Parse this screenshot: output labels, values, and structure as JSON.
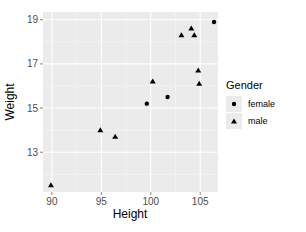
{
  "chart_data": {
    "type": "scatter",
    "title": "",
    "xlabel": "Height",
    "ylabel": "Weight",
    "xlim": [
      89.1,
      106.8
    ],
    "ylim": [
      11.2,
      19.35
    ],
    "xticks": [
      90,
      95,
      100,
      105
    ],
    "yticks": [
      13,
      15,
      17,
      19
    ],
    "grid": true,
    "legend": {
      "title": "Gender",
      "position": "right",
      "entries": [
        {
          "label": "female",
          "shape": "circle"
        },
        {
          "label": "male",
          "shape": "triangle"
        }
      ]
    },
    "series": [
      {
        "name": "female",
        "shape": "circle",
        "points": [
          {
            "x": 99.6,
            "y": 15.2
          },
          {
            "x": 101.7,
            "y": 15.5
          },
          {
            "x": 106.4,
            "y": 18.9
          }
        ]
      },
      {
        "name": "male",
        "shape": "triangle",
        "points": [
          {
            "x": 89.9,
            "y": 11.5
          },
          {
            "x": 94.9,
            "y": 14.0
          },
          {
            "x": 96.4,
            "y": 13.7
          },
          {
            "x": 100.2,
            "y": 16.2
          },
          {
            "x": 103.1,
            "y": 18.3
          },
          {
            "x": 104.1,
            "y": 18.6
          },
          {
            "x": 104.4,
            "y": 18.3
          },
          {
            "x": 104.8,
            "y": 16.7
          },
          {
            "x": 104.9,
            "y": 16.1
          }
        ]
      }
    ]
  },
  "colors": {
    "panel": "#ebebeb",
    "grid": "#ffffff",
    "point": "#000000",
    "tick": "#4d4d4d"
  }
}
